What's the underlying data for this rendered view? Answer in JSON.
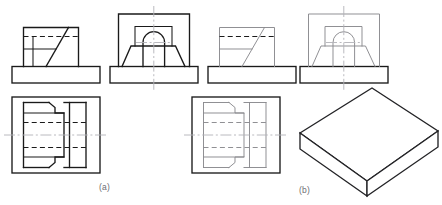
{
  "figure": {
    "kind": "technical-drawing",
    "background_color": "#ffffff",
    "line_color_heavy": "#1a1a1a",
    "line_color_light": "#8a8a8e",
    "centerline_color": "#aaaab0",
    "captions": [
      {
        "id": "a",
        "label": "(a)",
        "x": 99,
        "y": 182
      },
      {
        "id": "b",
        "label": "(b)",
        "x": 299,
        "y": 185
      }
    ],
    "panels": [
      {
        "id": "panel-a",
        "label": "(a)",
        "weight": "heavy",
        "views": [
          {
            "id": "front-view-a",
            "name": "front view",
            "description": "stepped block with inclined face on base plate, hidden line shown dashed"
          },
          {
            "id": "section-view-a",
            "name": "side section view",
            "description": "symmetrical trapezoid with semicircular arch and vertical centre line"
          },
          {
            "id": "top-view-a",
            "name": "top view",
            "description": "rectangular plan with stepped outline, two dashed hidden lines, horizontal centre line"
          }
        ]
      },
      {
        "id": "panel-b",
        "label": "(b)",
        "weight": "light",
        "views": [
          {
            "id": "front-view-b",
            "name": "front view",
            "description": "stepped block with inclined face on base plate, hidden line shown dashed"
          },
          {
            "id": "section-view-b",
            "name": "side section view",
            "description": "symmetrical trapezoid with semicircular arch and vertical centre line"
          },
          {
            "id": "top-view-b",
            "name": "top view",
            "description": "rectangular plan with stepped outline, two dashed hidden lines, horizontal centre line"
          },
          {
            "id": "isometric-slab",
            "name": "isometric pictorial",
            "description": "isometric rectangular slab / plate"
          }
        ]
      }
    ],
    "line_styles": {
      "visible": "continuous thick",
      "hidden": "dashed",
      "centre": "long dash dot"
    }
  }
}
